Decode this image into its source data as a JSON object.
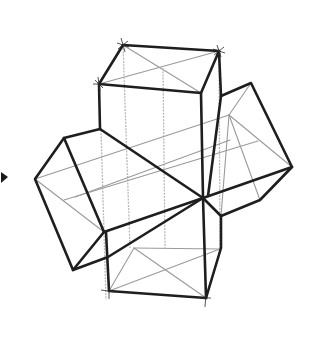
{
  "figure": {
    "style": "graphite line drawing",
    "colors": {
      "background": "#ffffff",
      "heavy_line": "#1e1e1e",
      "construction_line": "#9a9a9a"
    },
    "marker": {
      "icon": "triangle-right-marker",
      "position": [
        2,
        177
      ]
    }
  }
}
